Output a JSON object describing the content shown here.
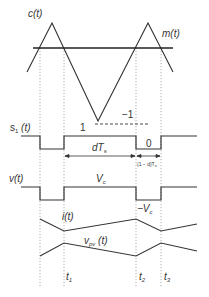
{
  "diagram": {
    "colors": {
      "line": "#333333",
      "dotted": "#999999",
      "background": "#ffffff"
    },
    "labels": {
      "carrier": "c(t)",
      "modulator": "m(t)",
      "switch": "s",
      "switch_sub": "1",
      "switch_suffix": " (t)",
      "level_high": "1",
      "level_low": "−1",
      "duty": "dT",
      "duty_sub": "s",
      "switch_zero": "0",
      "off_interval": "(1 − d)T",
      "off_interval_sub": "s",
      "voltage": "v(t)",
      "vc_pos": "V",
      "vc_pos_sub": "c",
      "vc_neg": "−V",
      "vc_neg_sub": "c",
      "current": "i(t)",
      "pv_voltage_v": "v",
      "pv_voltage_sub": "pv",
      "pv_voltage_suffix": " (t)",
      "t1": "t",
      "t1_sub": "1",
      "t2": "t",
      "t2_sub": "2",
      "t3": "t",
      "t3_sub": "3"
    },
    "time_marks": {
      "t_a": 40,
      "t1": 64,
      "t2": 136,
      "t3": 161
    }
  }
}
